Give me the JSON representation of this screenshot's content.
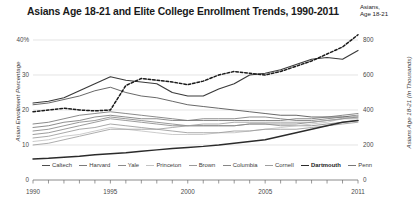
{
  "title": "Asians Age 18-21 and Elite College Enrollment Trends, 1990-2011",
  "annotation": {
    "line1": "Asians,",
    "line2": "Age 18-21"
  },
  "axes": {
    "left_title": "Asian Enrollment Percentage",
    "right_title": "Asians Age 18-21 (In Thousands)",
    "left_ticks": [
      "40%",
      "30",
      "20",
      "10",
      "0"
    ],
    "right_ticks": [
      "800",
      "600",
      "400",
      "200",
      "0"
    ],
    "x_ticks": [
      "1990",
      "1995",
      "2000",
      "2005",
      "2011"
    ]
  },
  "chart_data": {
    "type": "line",
    "title": "Asians Age 18-21 and Elite College Enrollment Trends, 1990-2011",
    "xlabel": "",
    "ylabel": "Asian Enrollment Percentage",
    "y2label": "Asians Age 18-21 (In Thousands)",
    "ylim": [
      0,
      40
    ],
    "y2lim": [
      0,
      800
    ],
    "grid": true,
    "legend_position": "bottom",
    "x": [
      1990,
      1991,
      1992,
      1993,
      1994,
      1995,
      1996,
      1997,
      1998,
      1999,
      2000,
      2001,
      2002,
      2003,
      2004,
      2005,
      2006,
      2007,
      2008,
      2009,
      2010,
      2011
    ],
    "series": [
      {
        "name": "Caltech",
        "color": "#4d4d4d",
        "width": 0.85,
        "values": [
          21.5,
          22.0,
          23.0,
          24.0,
          25.5,
          26.5,
          25.0,
          24.0,
          23.5,
          22.5,
          21.5,
          21.0,
          20.5,
          20.0,
          19.5,
          19.0,
          18.5,
          18.5,
          18.0,
          18.0,
          18.0,
          18.5
        ]
      },
      {
        "name": "Harvard",
        "color": "#7a7a7a",
        "width": 0.85,
        "values": [
          15.0,
          15.5,
          16.5,
          17.0,
          18.0,
          18.5,
          18.0,
          17.5,
          17.5,
          17.0,
          17.0,
          17.5,
          17.5,
          17.5,
          18.0,
          18.0,
          17.5,
          17.0,
          17.0,
          17.5,
          18.0,
          18.0
        ]
      },
      {
        "name": "Yale",
        "color": "#8a8a8a",
        "width": 0.85,
        "values": [
          13.0,
          13.5,
          14.5,
          15.5,
          16.5,
          17.5,
          17.0,
          16.5,
          16.0,
          15.5,
          15.5,
          15.5,
          15.5,
          15.5,
          16.0,
          16.0,
          15.5,
          15.5,
          15.5,
          16.0,
          16.5,
          17.0
        ]
      },
      {
        "name": "Princeton",
        "color": "#c3c3c3",
        "width": 0.85,
        "values": [
          11.0,
          11.5,
          12.5,
          13.0,
          14.0,
          15.0,
          14.5,
          14.0,
          13.5,
          13.0,
          13.0,
          13.0,
          13.5,
          13.5,
          14.0,
          14.5,
          15.0,
          15.5,
          16.0,
          16.5,
          17.5,
          18.5
        ]
      },
      {
        "name": "Brown",
        "color": "#9a9a9a",
        "width": 0.85,
        "values": [
          12.0,
          12.5,
          13.5,
          14.5,
          15.0,
          16.0,
          15.5,
          15.0,
          14.5,
          14.0,
          13.5,
          13.5,
          13.5,
          14.0,
          14.0,
          14.5,
          14.5,
          14.5,
          15.0,
          15.5,
          16.0,
          16.5
        ]
      },
      {
        "name": "Columbia",
        "color": "#868686",
        "width": 0.85,
        "values": [
          14.0,
          14.5,
          15.5,
          16.5,
          17.0,
          18.0,
          17.5,
          17.0,
          16.5,
          16.0,
          15.5,
          15.5,
          15.5,
          15.5,
          16.0,
          16.0,
          16.0,
          16.0,
          16.5,
          17.0,
          17.5,
          18.0
        ]
      },
      {
        "name": "Cornell",
        "color": "#9e9e9e",
        "width": 0.85,
        "values": [
          10.0,
          10.5,
          11.5,
          12.5,
          13.5,
          14.5,
          14.5,
          14.5,
          14.5,
          15.0,
          15.5,
          16.0,
          16.0,
          16.5,
          16.5,
          16.5,
          16.5,
          16.5,
          16.5,
          17.0,
          17.5,
          17.5
        ]
      },
      {
        "name": "Dartmouth",
        "color": "#2b2b2b",
        "width": 1.45,
        "values": [
          6.0,
          6.2,
          6.5,
          6.8,
          7.2,
          7.5,
          7.8,
          8.2,
          8.6,
          9.0,
          9.3,
          9.6,
          10.0,
          10.5,
          11.0,
          11.5,
          12.5,
          13.5,
          14.5,
          15.5,
          16.5,
          17.0
        ]
      },
      {
        "name": "Penn",
        "color": "#767676",
        "width": 0.85,
        "values": [
          16.0,
          16.5,
          17.5,
          18.5,
          19.0,
          19.5,
          19.0,
          18.5,
          18.0,
          17.5,
          17.0,
          17.0,
          17.0,
          17.0,
          17.0,
          17.0,
          17.0,
          17.5,
          17.5,
          18.0,
          18.5,
          19.0
        ]
      }
    ],
    "highlight_series": {
      "name": "Caltech-top",
      "color": "#3a3a3a",
      "width": 1.2,
      "values": [
        22.0,
        22.5,
        23.5,
        25.5,
        27.5,
        29.5,
        28.5,
        28.0,
        27.5,
        25.0,
        24.0,
        24.0,
        26.0,
        27.5,
        30.0,
        30.5,
        31.5,
        33.0,
        34.5,
        35.0,
        34.5,
        37.0
      ]
    },
    "population_series": {
      "name": "Asians, Age 18-21",
      "units": "thousands",
      "dashed": true,
      "color": "#1a1a1a",
      "width": 1.5,
      "values": [
        390,
        400,
        410,
        400,
        395,
        400,
        540,
        580,
        570,
        560,
        545,
        565,
        600,
        620,
        610,
        600,
        620,
        650,
        680,
        720,
        760,
        830
      ]
    }
  },
  "legend": [
    {
      "label": "Caltech",
      "color": "#4d4d4d",
      "emphasis": false
    },
    {
      "label": "Harvard",
      "color": "#7a7a7a",
      "emphasis": false
    },
    {
      "label": "Yale",
      "color": "#8a8a8a",
      "emphasis": false
    },
    {
      "label": "Princeton",
      "color": "#c3c3c3",
      "emphasis": false
    },
    {
      "label": "Brown",
      "color": "#9a9a9a",
      "emphasis": false
    },
    {
      "label": "Columbia",
      "color": "#868686",
      "emphasis": false
    },
    {
      "label": "Cornell",
      "color": "#9e9e9e",
      "emphasis": false
    },
    {
      "label": "Dartmouth",
      "color": "#2b2b2b",
      "emphasis": true
    },
    {
      "label": "Penn",
      "color": "#767676",
      "emphasis": false
    }
  ]
}
